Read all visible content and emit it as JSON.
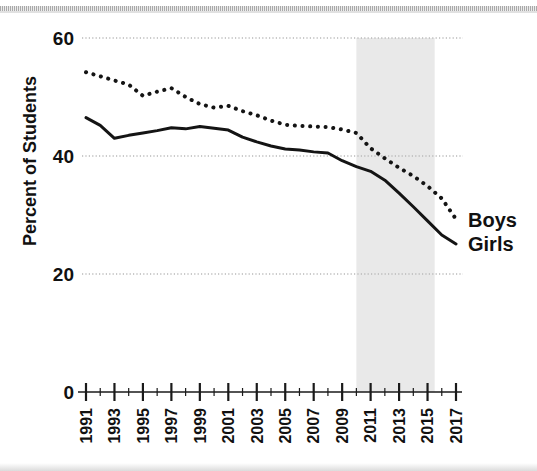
{
  "figure": {
    "background_color": "#ffffff",
    "ink_color": "#1a1a1a",
    "shade_color": "#e9e9e9"
  },
  "axes": {
    "y_axis_title": "Percent of Students",
    "y_tick_labels": [
      "60",
      "40",
      "20",
      "0"
    ],
    "x_tick_labels": [
      "1991",
      "1993",
      "1995",
      "1997",
      "1999",
      "2001",
      "2003",
      "2005",
      "2007",
      "2009",
      "2011",
      "2013",
      "2015",
      "2017"
    ]
  },
  "series_labels": {
    "boys": "Boys",
    "girls": "Girls"
  },
  "chart_data": {
    "type": "line",
    "title": "",
    "subtitle": "",
    "xlabel": "",
    "ylabel": "Percent of Students",
    "xlim": [
      1991,
      2017
    ],
    "ylim": [
      0,
      60
    ],
    "yticks": [
      0,
      20,
      40,
      60
    ],
    "xticks": [
      1991,
      1993,
      1995,
      1997,
      1999,
      2001,
      2003,
      2005,
      2007,
      2009,
      2011,
      2013,
      2015,
      2017
    ],
    "grid": "horizontal-dotted",
    "legend_position": "right-inline-at-line-end",
    "annotations": [
      {
        "type": "shaded-band",
        "x_start": 2010,
        "x_end": 2015.5,
        "color": "#e9e9e9"
      }
    ],
    "x": [
      1991,
      1992,
      1993,
      1994,
      1995,
      1996,
      1997,
      1998,
      1999,
      2000,
      2001,
      2002,
      2003,
      2004,
      2005,
      2006,
      2007,
      2008,
      2009,
      2010,
      2011,
      2012,
      2013,
      2014,
      2015,
      2016,
      2017
    ],
    "series": [
      {
        "name": "Boys",
        "style": "dotted",
        "values": [
          54.2,
          53.5,
          52.8,
          52.1,
          50.2,
          50.9,
          51.5,
          50.0,
          48.8,
          48.2,
          48.5,
          47.6,
          46.9,
          46.0,
          45.3,
          45.1,
          45.0,
          44.9,
          44.5,
          43.9,
          41.3,
          39.6,
          38.0,
          36.6,
          34.9,
          32.8,
          29.3
        ]
      },
      {
        "name": "Girls",
        "style": "solid",
        "values": [
          46.5,
          45.2,
          43.0,
          43.5,
          43.9,
          44.3,
          44.8,
          44.6,
          45.0,
          44.7,
          44.4,
          43.2,
          42.4,
          41.7,
          41.2,
          41.0,
          40.7,
          40.5,
          39.2,
          38.2,
          37.4,
          35.9,
          33.7,
          31.4,
          29.0,
          26.6,
          25.1
        ]
      }
    ]
  }
}
